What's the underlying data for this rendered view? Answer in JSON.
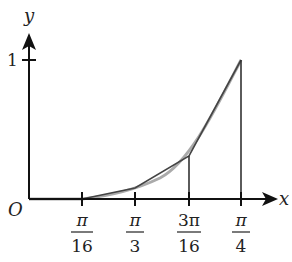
{
  "figure": {
    "type": "function-graph-with-secant-approximation",
    "axes": {
      "x_label": "x",
      "y_label": "y",
      "origin_label": "O",
      "y_tick_label": "1"
    },
    "x_ticks": [
      {
        "num": "π",
        "den": "16"
      },
      {
        "num": "π",
        "den": "3"
      },
      {
        "num": "3π",
        "den": "16"
      },
      {
        "num": "π",
        "den": "4"
      }
    ],
    "curve": {
      "description": "smooth increasing convex curve from origin to (π/4, 1)",
      "color": "#aaaaaa"
    },
    "polyline": {
      "description": "secant segments joining curve points at tick positions",
      "color": "#444444"
    },
    "vertical_lines_at": [
      "3π/16",
      "π/4"
    ]
  }
}
